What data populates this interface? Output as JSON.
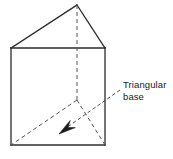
{
  "figure": {
    "name": "triangular-prism-diagram",
    "background_color": "#ffffff",
    "line_color": "#2b2b2b",
    "hidden_line_color": "#555555",
    "text_color": "#1a1a1a",
    "solid_stroke_width": 1.3,
    "hidden_stroke_width": 1.0,
    "leader_stroke_width": 0.9,
    "hidden_dash_pattern": "4,3",
    "leader_dash_pattern": "3.5,2.5"
  },
  "annotation": {
    "label_line_1": "Triangular",
    "label_line_2": "base",
    "leader_start": {
      "x": 120,
      "y": 90
    },
    "leader_end": {
      "x": 63,
      "y": 130
    },
    "arrow_tip": {
      "x": 59,
      "y": 134
    }
  },
  "vertices": {
    "apex_back_top": {
      "x": 77,
      "y": 5
    },
    "front_left_top": {
      "x": 11,
      "y": 48
    },
    "front_right_top": {
      "x": 105,
      "y": 48
    },
    "front_left_bottom": {
      "x": 11,
      "y": 145
    },
    "front_right_bottom": {
      "x": 105,
      "y": 145
    },
    "hidden_back_bottom": {
      "x": 77,
      "y": 100
    }
  },
  "edges": {
    "solid": [
      {
        "name": "top-left-slant",
        "from": "front_left_top",
        "to": "apex_back_top"
      },
      {
        "name": "top-right-slant",
        "from": "apex_back_top",
        "to": "front_right_top"
      },
      {
        "name": "front-face-top",
        "from": "front_left_top",
        "to": "front_right_top"
      },
      {
        "name": "front-face-left",
        "from": "front_left_top",
        "to": "front_left_bottom"
      },
      {
        "name": "front-face-right",
        "from": "front_right_top",
        "to": "front_right_bottom"
      },
      {
        "name": "front-face-bottom",
        "from": "front_left_bottom",
        "to": "front_right_bottom"
      }
    ],
    "hidden": [
      {
        "name": "hidden-vertical-edge",
        "from": "apex_back_top",
        "to": "hidden_back_bottom"
      },
      {
        "name": "hidden-base-left",
        "from": "hidden_back_bottom",
        "to": "front_left_bottom"
      },
      {
        "name": "hidden-base-right",
        "from": "hidden_back_bottom",
        "to": "front_right_bottom"
      }
    ]
  }
}
